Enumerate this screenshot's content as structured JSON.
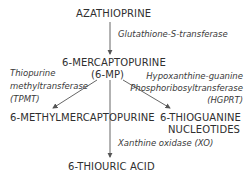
{
  "nodes": {
    "azathioprine": "AZATHIOPRINE",
    "mercaptopurine": "6-MERCAPTOPURINE",
    "mercaptopurine_abbr": "(6-MP)",
    "methylmercaptopurine": "6-METHYLMERCAPTOPURINE",
    "thioguanine_line1": "6-THIOGUANINE",
    "thioguanine_line2": "NUCLEOTIDES",
    "thiouric_acid": "6-THIOURIC ACID"
  },
  "enzymes": {
    "gst": "Glutathione-S-transferase",
    "tpmt_line1": "Thiopurine",
    "tpmt_line2": "methyltransferase",
    "tpmt_abbr": "(TPMT)",
    "hgprt_line1": "Hypoxanthine-guanine",
    "hgprt_line2": "Phosphoribosyltransferase",
    "hgprt_abbr": "(HGPRT)",
    "xo": "Xanthine oxidase (XO)"
  },
  "colors": {
    "text": "#2f2f2f",
    "arrow": "#555555",
    "background": "#ffffff"
  }
}
